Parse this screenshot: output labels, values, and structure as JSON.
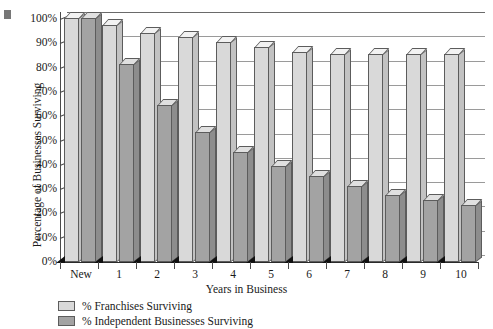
{
  "chart_data": {
    "type": "bar",
    "title": "",
    "xlabel": "Years in Business",
    "ylabel": "Percentage of Businesses Surviving",
    "categories": [
      "New",
      "1",
      "2",
      "3",
      "4",
      "5",
      "6",
      "7",
      "8",
      "9",
      "10"
    ],
    "ylim": [
      0,
      100
    ],
    "ytick_labels": [
      "0%",
      "10%",
      "20%",
      "30%",
      "40%",
      "50%",
      "60%",
      "70%",
      "80%",
      "90%",
      "100%"
    ],
    "ytick_values": [
      0,
      10,
      20,
      30,
      40,
      50,
      60,
      70,
      80,
      90,
      100
    ],
    "grid": true,
    "legend_position": "bottom-left",
    "series": [
      {
        "name": "% Franchises Surviving",
        "color": "#d9d9d9",
        "values": [
          100,
          97,
          94,
          92,
          90,
          88,
          86,
          85,
          85,
          85,
          85
        ]
      },
      {
        "name": "% Independent Businesses Surviving",
        "color": "#a3a3a3",
        "values": [
          100,
          81,
          64,
          53,
          45,
          39,
          35,
          31,
          27,
          25,
          23
        ]
      }
    ]
  },
  "legend": {
    "items": [
      {
        "label": "% Franchises Surviving",
        "swatch": "light"
      },
      {
        "label": "% Independent Businesses Surviving",
        "swatch": "dark"
      }
    ]
  }
}
